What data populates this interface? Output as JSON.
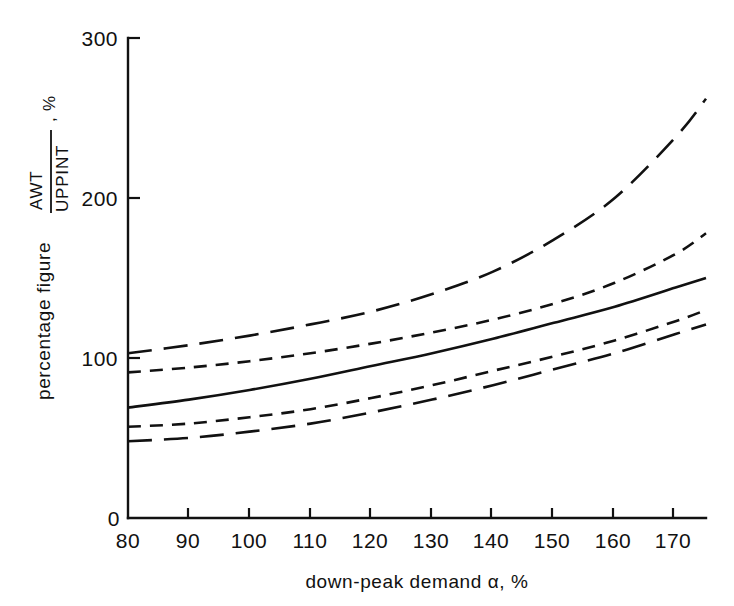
{
  "chart_data": {
    "type": "line",
    "title": "",
    "xlabel": "down-peak demand α, %",
    "ylabel_main": "percentage figure",
    "ylabel_numerator": "AWT",
    "ylabel_denominator": "UPPINT",
    "ylabel_unit": ", %",
    "xlim": [
      80,
      175
    ],
    "ylim": [
      0,
      300
    ],
    "xticks": [
      80,
      90,
      100,
      110,
      120,
      130,
      140,
      150,
      160,
      170
    ],
    "yticks": [
      0,
      100,
      200,
      300
    ],
    "xtick_labels": [
      "80",
      "90",
      "100",
      "110",
      "120",
      "130",
      "140",
      "150",
      "160",
      "170"
    ],
    "ytick_labels": [
      "0",
      "100",
      "200",
      "300"
    ],
    "grid": false,
    "legend": "none",
    "x": [
      80,
      90,
      100,
      110,
      120,
      130,
      140,
      150,
      160,
      170,
      175
    ],
    "series": [
      {
        "name": "upper-outer-bound",
        "style": "long-dashed",
        "values": [
          103,
          108,
          114,
          121,
          129,
          140,
          154,
          174,
          200,
          238,
          262
        ]
      },
      {
        "name": "upper-inner-bound",
        "style": "short-dashed",
        "values": [
          91,
          94,
          98,
          103,
          109,
          116,
          124,
          134,
          147,
          165,
          178
        ]
      },
      {
        "name": "mean-curve",
        "style": "solid",
        "values": [
          69,
          74,
          80,
          87,
          95,
          103,
          112,
          122,
          132,
          144,
          150
        ]
      },
      {
        "name": "lower-inner-bound",
        "style": "short-dashed",
        "values": [
          57,
          59,
          63,
          68,
          75,
          83,
          92,
          101,
          111,
          123,
          130
        ]
      },
      {
        "name": "lower-outer-bound",
        "style": "long-dashed",
        "values": [
          48,
          50,
          54,
          59,
          66,
          74,
          83,
          93,
          103,
          115,
          121
        ]
      }
    ]
  }
}
